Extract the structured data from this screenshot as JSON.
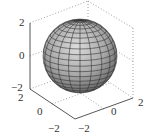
{
  "chart_data": {
    "type": "surface3d",
    "title": "",
    "surface": {
      "shape": "sphere",
      "center": [
        0,
        0,
        0
      ],
      "radius": 2,
      "mesh": {
        "latitude_lines": 20,
        "longitude_lines": 20
      },
      "colormap": "gray"
    },
    "axes": {
      "x": {
        "label": "",
        "ticks": [
          "-2",
          "0",
          "2"
        ],
        "range": [
          -2,
          2
        ]
      },
      "y": {
        "label": "",
        "ticks": [
          "-2",
          "0",
          "2"
        ],
        "range": [
          -2,
          2
        ]
      },
      "z": {
        "label": "",
        "ticks": [
          "-2",
          "0",
          "2"
        ],
        "range": [
          -2,
          2
        ]
      }
    },
    "grid": true,
    "box": "dotted back edges",
    "legend": null
  },
  "labels": {
    "z": {
      "top": "2",
      "mid": "0",
      "bottom": "−2"
    },
    "y": {
      "near": "2",
      "mid": "0",
      "far": "−2"
    },
    "x": {
      "near": "−2",
      "mid": "0",
      "far": "2"
    }
  },
  "colors": {
    "axis": "#444444",
    "grid": "#888888",
    "mesh": "#333333",
    "sphere_light": "#d6d6d6",
    "sphere_dark": "#5a5a5a"
  }
}
